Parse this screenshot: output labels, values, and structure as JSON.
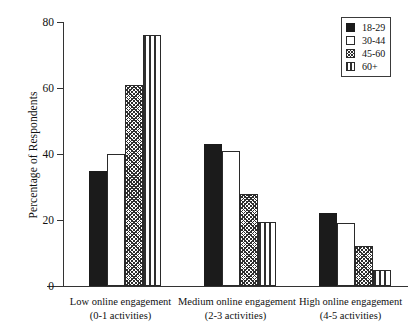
{
  "chart_data": {
    "type": "bar",
    "title": "",
    "xlabel": "",
    "ylabel": "Percentage of Respondents",
    "ylim": [
      0,
      80
    ],
    "yticks": [
      0,
      20,
      40,
      60,
      80
    ],
    "grid": false,
    "legend_position": "top-right",
    "categories": [
      "Low online engagement\n(0-1 activities)",
      "Medium online engagement\n(2-3 activities)",
      "High online engagement\n(4-5 activities)"
    ],
    "category_lines": [
      {
        "line1": "Low online engagement",
        "line2": "(0-1 activities)"
      },
      {
        "line1": "Medium online engagement",
        "line2": "(2-3 activities)"
      },
      {
        "line1": "High online engagement",
        "line2": "(4-5 activities)"
      }
    ],
    "series": [
      {
        "name": "18-29",
        "fill": "solid",
        "values": [
          35,
          43,
          22
        ]
      },
      {
        "name": "30-44",
        "fill": "open",
        "values": [
          40,
          41,
          19
        ]
      },
      {
        "name": "45-60",
        "fill": "hatch",
        "values": [
          61,
          28,
          12
        ]
      },
      {
        "name": "60+",
        "fill": "vstripe",
        "values": [
          76,
          19.5,
          5
        ]
      }
    ]
  },
  "axis": {
    "y_title": "Percentage of Respondents",
    "y_tick_labels": [
      "0",
      "20",
      "40",
      "60",
      "80"
    ]
  },
  "legend": {
    "entries": [
      {
        "label": "18-29",
        "fill": "solid"
      },
      {
        "label": "30-44",
        "fill": "open"
      },
      {
        "label": "45-60",
        "fill": "hatch"
      },
      {
        "label": "60+",
        "fill": "vstripe"
      }
    ]
  }
}
